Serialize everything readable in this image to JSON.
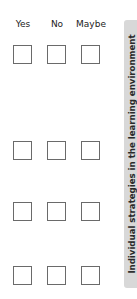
{
  "columns": [
    "Yes",
    "No",
    "Maybe"
  ],
  "rows": [
    {
      "yes": false,
      "no": false,
      "maybe": false
    },
    {
      "yes": false,
      "no": false,
      "maybe": false
    },
    {
      "yes": false,
      "no": false,
      "maybe": false
    },
    {
      "yes": false,
      "no": false,
      "maybe": false
    }
  ],
  "side_tab": {
    "label": "Individual strategies in the learning environment",
    "color": "#d8d8d8"
  }
}
